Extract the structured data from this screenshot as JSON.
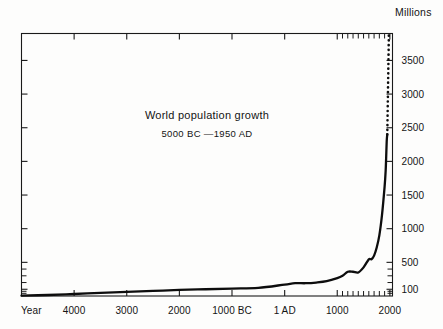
{
  "chart_data": {
    "type": "line",
    "title": "World population growth",
    "subtitle": "5000 BC —1950 AD",
    "xlabel": "Year",
    "ylabel": "Millions",
    "grid": false,
    "legend": "none",
    "xlim": [
      -5000,
      2050
    ],
    "ylim": [
      0,
      3900
    ],
    "x_tick_labels": [
      "4000",
      "3000",
      "2000",
      "1000 BC",
      "1 AD",
      "1000",
      "2000"
    ],
    "x_tick_values": [
      -4000,
      -3000,
      -2000,
      -1000,
      1,
      1000,
      2000
    ],
    "x_minor_tick_values": [
      1100,
      1200,
      1300,
      1400,
      1500,
      1600,
      1700,
      1800,
      1900
    ],
    "y_tick_labels": [
      "100",
      "500",
      "1000",
      "1500",
      "2000",
      "2500",
      "3000",
      "3500"
    ],
    "y_tick_values": [
      100,
      500,
      1000,
      1500,
      2000,
      2500,
      3000,
      3500
    ],
    "y_minor_tick_values": [
      40,
      70,
      200,
      300,
      400
    ],
    "series": [
      {
        "name": "World population (observed)",
        "style": "solid",
        "x": [
          -5000,
          -4500,
          -4000,
          -3500,
          -3000,
          -2500,
          -2000,
          -1500,
          -1000,
          -500,
          1,
          200,
          400,
          600,
          800,
          1000,
          1100,
          1200,
          1300,
          1400,
          1500,
          1600,
          1650,
          1700,
          1750,
          1800,
          1850,
          1900,
          1920,
          1930,
          1940,
          1950
        ],
        "y": [
          5,
          15,
          30,
          45,
          60,
          75,
          90,
          100,
          110,
          120,
          170,
          190,
          190,
          200,
          220,
          265,
          300,
          360,
          360,
          350,
          425,
          545,
          545,
          600,
          720,
          900,
          1200,
          1625,
          1860,
          2070,
          2300,
          2400
        ]
      },
      {
        "name": "Projection",
        "style": "dotted",
        "x": [
          1950,
          1956,
          1962,
          1968,
          1974,
          1980
        ],
        "y": [
          2400,
          2650,
          2950,
          3250,
          3550,
          3870
        ]
      }
    ],
    "annotations": []
  }
}
